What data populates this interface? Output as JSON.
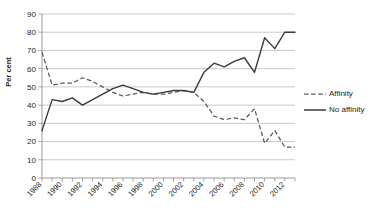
{
  "chart_data": {
    "type": "line",
    "title": "",
    "xlabel": "",
    "ylabel": "Per cent",
    "ylim": [
      0,
      90
    ],
    "ytick_step": 10,
    "yticks": [
      0,
      10,
      20,
      30,
      40,
      50,
      60,
      70,
      80,
      90
    ],
    "xlim": [
      1988,
      2013
    ],
    "xticks_labeled": [
      1988,
      1990,
      1992,
      1994,
      1996,
      1998,
      2000,
      2002,
      2004,
      2006,
      2008,
      2010,
      2012
    ],
    "xtick_minor_every": 1,
    "grid": "horizontal",
    "legend_position": "right",
    "x": [
      1988,
      1989,
      1990,
      1991,
      1992,
      1993,
      1994,
      1995,
      1996,
      1997,
      1998,
      1999,
      2000,
      2001,
      2002,
      2003,
      2004,
      2005,
      2006,
      2007,
      2008,
      2009,
      2010,
      2011,
      2012,
      2013
    ],
    "series": [
      {
        "name": "Affinity",
        "style": "dashed",
        "color": "#5a5a5a",
        "values": [
          69,
          51,
          52,
          52,
          55,
          53,
          50,
          47,
          45,
          46,
          47,
          46,
          46,
          47,
          48,
          47,
          42,
          34,
          32,
          33,
          32,
          38,
          19,
          26,
          17,
          17
        ]
      },
      {
        "name": "No affinity",
        "style": "solid",
        "color": "#3b3b3b",
        "values": [
          26,
          43,
          42,
          44,
          40,
          43,
          46,
          49,
          51,
          49,
          47,
          46,
          47,
          48,
          48,
          47,
          58,
          63,
          61,
          64,
          66,
          58,
          77,
          71,
          80,
          80
        ]
      }
    ]
  },
  "axis": {
    "y_title": "Per cent"
  },
  "legend": {
    "items": [
      {
        "label": "Affinity"
      },
      {
        "label": "No affinity"
      }
    ]
  }
}
